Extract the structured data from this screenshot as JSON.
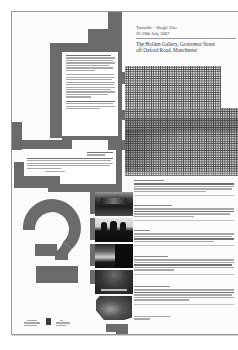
{
  "poster": {
    "title": "Turnstile - Single Use:",
    "dates": "26-28th July 2007",
    "venue_line1": "The Holden Gallery, Grosvenor Street",
    "venue_line2": "off Oxford Road, Manchester"
  },
  "intro_panel": {
    "paragraphs": [
      {
        "lines": 7
      },
      {
        "lines": 10
      },
      {
        "lines": 4
      }
    ]
  },
  "caption_panel": {
    "heading_lines": 2,
    "body_lines": 5
  },
  "sections": [
    {
      "heading": "Artist 1",
      "body_lines": 4
    },
    {
      "heading": "Artist 2",
      "body_lines": 4
    },
    {
      "heading": "Artist 3",
      "body_lines": 4
    },
    {
      "heading": "Artist 4",
      "body_lines": 5
    },
    {
      "heading": "Artist 5",
      "body_lines": 5
    },
    {
      "heading": "Artist 6",
      "body_lines": 2
    }
  ],
  "photos": [
    {
      "name": "photo-corridor",
      "tone": "dark"
    },
    {
      "name": "photo-silhouette",
      "tone": "silhouette"
    },
    {
      "name": "photo-landscape",
      "tone": "mixed"
    },
    {
      "name": "photo-dome",
      "tone": "dark"
    },
    {
      "name": "photo-group",
      "tone": "mixed"
    }
  ],
  "colors": {
    "block_gray": "#6b6b6b",
    "paper": "#fbfbfb",
    "border": "#9a9a9a",
    "text": "#333333"
  },
  "logos": [
    "logo-1",
    "logo-2",
    "logo-3"
  ]
}
